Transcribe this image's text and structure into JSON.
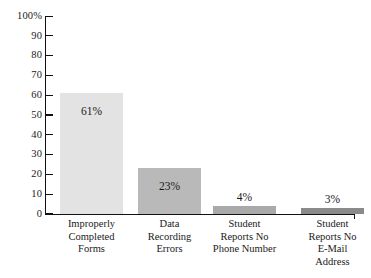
{
  "chart_data": {
    "type": "bar",
    "title": "",
    "subtitle": "",
    "xlabel": "",
    "ylabel": "",
    "ylim": [
      0,
      100
    ],
    "grid": false,
    "legend": "none",
    "categories": [
      "Improperly Completed Forms",
      "Data Recording Errors",
      "Student Reports No Phone Number",
      "Student Reports No E-Mail Address"
    ],
    "category_lines": [
      [
        "Improperly",
        "Completed",
        "Forms"
      ],
      [
        "Data",
        "Recording",
        "Errors"
      ],
      [
        "Student",
        "Reports No",
        "Phone Number"
      ],
      [
        "Student",
        "Reports No",
        "E-Mail",
        "Address"
      ]
    ],
    "values": [
      61,
      23,
      4,
      3
    ],
    "value_labels": [
      "61%",
      "23%",
      "4%",
      "3%"
    ],
    "bar_colors": [
      "#e3e3e3",
      "#b9b9b9",
      "#a9a9a9",
      "#8a8a8a"
    ],
    "label_placement": [
      "inside",
      "inside",
      "above",
      "above"
    ],
    "y_ticks": [
      0,
      10,
      20,
      30,
      40,
      50,
      60,
      70,
      80,
      90,
      100
    ],
    "y_tick_labels": [
      "0",
      "10",
      "20",
      "30",
      "40",
      "50",
      "60",
      "70",
      "80",
      "90",
      "100%"
    ],
    "axis_color": "#111111",
    "text_color": "#1a1a1a",
    "background": "#ffffff"
  }
}
